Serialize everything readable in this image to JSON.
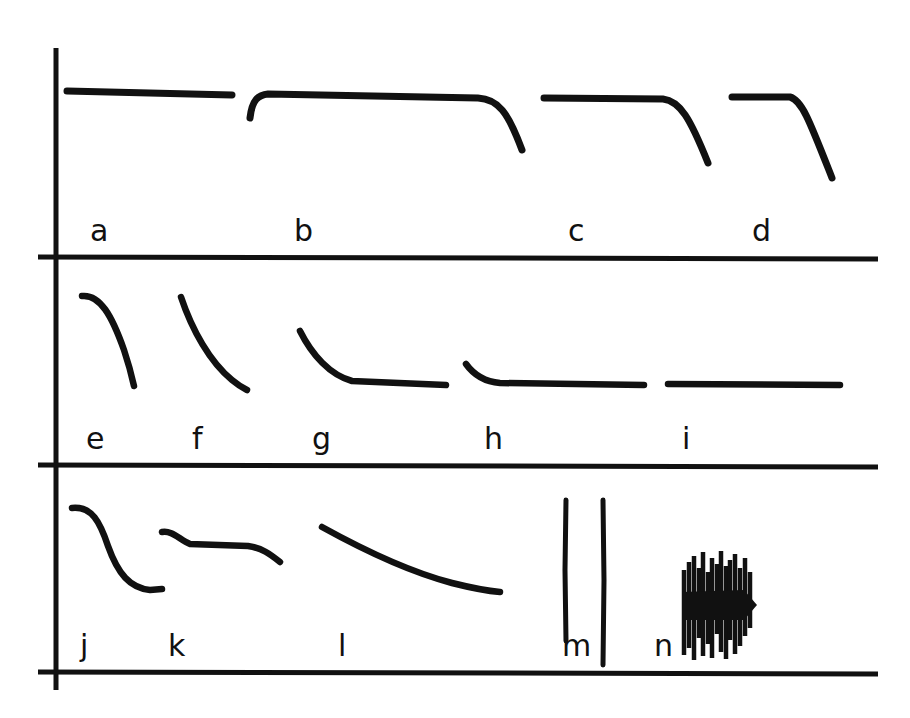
{
  "figure": {
    "background_color": "#ffffff",
    "ink_color": "#111111",
    "width": 910,
    "height": 718,
    "rows": 3,
    "panel_count": 14
  },
  "axes": {
    "y_axis": {
      "name": "vertical-axis",
      "x": 56,
      "y_top": 48,
      "y_bottom": 690,
      "stroke_width": 5
    },
    "baselines": [
      {
        "name": "baseline-row-1",
        "y": 257,
        "x_start": 38,
        "x_end": 878,
        "stroke_width": 5
      },
      {
        "name": "baseline-row-2",
        "y": 465,
        "x_start": 38,
        "x_end": 878,
        "stroke_width": 5
      },
      {
        "name": "baseline-row-3",
        "y": 672,
        "x_start": 38,
        "x_end": 878,
        "stroke_width": 5
      }
    ]
  },
  "labels": {
    "row1": [
      {
        "id": "a",
        "text": "a",
        "x": 90,
        "y": 216
      },
      {
        "id": "b",
        "text": "b",
        "x": 294,
        "y": 216
      },
      {
        "id": "c",
        "text": "c",
        "x": 568,
        "y": 216
      },
      {
        "id": "d",
        "text": "d",
        "x": 752,
        "y": 216
      }
    ],
    "row2": [
      {
        "id": "e",
        "text": "e",
        "x": 86,
        "y": 424
      },
      {
        "id": "f",
        "text": "f",
        "x": 192,
        "y": 424
      },
      {
        "id": "g",
        "text": "g",
        "x": 312,
        "y": 424
      },
      {
        "id": "h",
        "text": "h",
        "x": 484,
        "y": 424
      },
      {
        "id": "i",
        "text": "i",
        "x": 682,
        "y": 424
      }
    ],
    "row3": [
      {
        "id": "j",
        "text": "j",
        "x": 80,
        "y": 631
      },
      {
        "id": "k",
        "text": "k",
        "x": 168,
        "y": 631
      },
      {
        "id": "l",
        "text": "l",
        "x": 338,
        "y": 631
      },
      {
        "id": "m",
        "text": "m",
        "x": 562,
        "y": 631
      },
      {
        "id": "n",
        "text": "n",
        "x": 654,
        "y": 631
      }
    ]
  },
  "chart_data": {
    "type": "line",
    "xlabel": "",
    "ylabel": "",
    "grid": false,
    "legend_position": "none",
    "panels": [
      {
        "label": "a",
        "row": 1,
        "shape": "flat plateau, no decay",
        "path": "M67,91 L232,95",
        "points": [
          [
            67,
            91
          ],
          [
            232,
            95
          ]
        ]
      },
      {
        "label": "b",
        "row": 1,
        "shape": "short rise, long plateau, steep terminal fall",
        "path": "M250,118 C252,100 258,95 268,94 L478,98 C498,99 508,112 522,150",
        "points": [
          [
            250,
            118
          ],
          [
            268,
            94
          ],
          [
            478,
            98
          ],
          [
            522,
            150
          ]
        ]
      },
      {
        "label": "c",
        "row": 1,
        "shape": "plateau with steep fall, shorter plateau than b",
        "path": "M544,98 L663,99 C680,101 690,118 708,163",
        "points": [
          [
            544,
            98
          ],
          [
            663,
            99
          ],
          [
            708,
            163
          ]
        ]
      },
      {
        "label": "d",
        "row": 1,
        "shape": "short plateau with steep fall",
        "path": "M732,97 L790,97 C802,100 810,122 832,178",
        "points": [
          [
            732,
            97
          ],
          [
            790,
            97
          ],
          [
            832,
            178
          ]
        ]
      },
      {
        "label": "e",
        "row": 2,
        "shape": "rounded shoulder then steep monotonic fall",
        "path": "M82,296 C100,294 112,316 124,350 C129,365 132,377 134,386",
        "points": [
          [
            82,
            296
          ],
          [
            112,
            316
          ],
          [
            134,
            386
          ]
        ]
      },
      {
        "label": "f",
        "row": 2,
        "shape": "steep concave fall, no plateau",
        "path": "M181,297 C192,330 210,362 232,380 C238,385 243,388 247,390",
        "points": [
          [
            181,
            297
          ],
          [
            232,
            380
          ],
          [
            247,
            390
          ]
        ]
      },
      {
        "label": "g",
        "row": 2,
        "shape": "exponential decay to long plateau",
        "path": "M300,331 C312,355 330,375 352,381 L446,385",
        "points": [
          [
            300,
            331
          ],
          [
            352,
            381
          ],
          [
            446,
            385
          ]
        ]
      },
      {
        "label": "h",
        "row": 2,
        "shape": "small fast decay to long plateau",
        "path": "M466,364 C476,378 488,382 500,383 L644,385",
        "points": [
          [
            466,
            364
          ],
          [
            500,
            383
          ],
          [
            644,
            385
          ]
        ]
      },
      {
        "label": "i",
        "row": 2,
        "shape": "flat baseline only, no decay",
        "path": "M668,384 L840,385",
        "points": [
          [
            668,
            384
          ],
          [
            840,
            385
          ]
        ]
      },
      {
        "label": "j",
        "row": 3,
        "shape": "sigmoid S-shaped fall with low plateau",
        "path": "M72,508 C92,506 100,522 108,546 C118,574 130,588 150,590 L162,589",
        "points": [
          [
            72,
            508
          ],
          [
            108,
            546
          ],
          [
            150,
            590
          ],
          [
            162,
            589
          ]
        ]
      },
      {
        "label": "k",
        "row": 3,
        "shape": "small initial drop, long plateau, terminal droop",
        "path": "M162,532 C172,530 180,540 190,544 L248,546 C262,548 270,554 280,562",
        "points": [
          [
            162,
            532
          ],
          [
            190,
            544
          ],
          [
            248,
            546
          ],
          [
            280,
            562
          ]
        ]
      },
      {
        "label": "l",
        "row": 3,
        "shape": "slow gradual continuous decline",
        "path": "M322,527 C360,548 410,572 452,583 C472,588 488,591 500,592",
        "points": [
          [
            322,
            527
          ],
          [
            452,
            583
          ],
          [
            500,
            592
          ]
        ]
      },
      {
        "label": "m",
        "row": 3,
        "shape": "two isolated tall narrow spikes",
        "spikes": [
          {
            "x": 566,
            "y_top": 500,
            "y_bottom": 641
          },
          {
            "x": 603,
            "y_top": 500,
            "y_bottom": 665
          }
        ]
      },
      {
        "label": "n",
        "row": 3,
        "shape": "dense burst of many overlapping spikes with solid core and pointed right tip",
        "x_start": 682,
        "x_end": 757,
        "y_top": 550,
        "y_bottom": 660,
        "core_band": [
          594,
          618
        ],
        "spikes": [
          {
            "x": 684,
            "y_top": 570,
            "y_bottom": 655
          },
          {
            "x": 689,
            "y_top": 562,
            "y_bottom": 648
          },
          {
            "x": 694,
            "y_top": 556,
            "y_bottom": 660
          },
          {
            "x": 699,
            "y_top": 568,
            "y_bottom": 638
          },
          {
            "x": 703,
            "y_top": 552,
            "y_bottom": 656
          },
          {
            "x": 708,
            "y_top": 572,
            "y_bottom": 644
          },
          {
            "x": 712,
            "y_top": 558,
            "y_bottom": 658
          },
          {
            "x": 717,
            "y_top": 564,
            "y_bottom": 634
          },
          {
            "x": 721,
            "y_top": 551,
            "y_bottom": 652
          },
          {
            "x": 726,
            "y_top": 566,
            "y_bottom": 659
          },
          {
            "x": 730,
            "y_top": 560,
            "y_bottom": 640
          },
          {
            "x": 735,
            "y_top": 554,
            "y_bottom": 654
          },
          {
            "x": 740,
            "y_top": 568,
            "y_bottom": 646
          },
          {
            "x": 745,
            "y_top": 558,
            "y_bottom": 636
          },
          {
            "x": 750,
            "y_top": 572,
            "y_bottom": 628
          }
        ]
      }
    ]
  }
}
